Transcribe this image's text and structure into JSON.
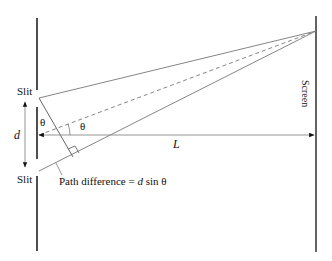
{
  "diagram": {
    "labels": {
      "slit_top": "Slit",
      "slit_bottom": "Slit",
      "screen": "Screen",
      "separation": "d",
      "distance": "L",
      "angle_left": "θ",
      "angle_center": "θ",
      "path_difference_prefix": "Path difference = ",
      "path_difference_var": "d",
      "path_difference_suffix": " sin θ"
    },
    "colors": {
      "barrier": "#222222",
      "ray": "#666666",
      "text": "#111111"
    }
  }
}
